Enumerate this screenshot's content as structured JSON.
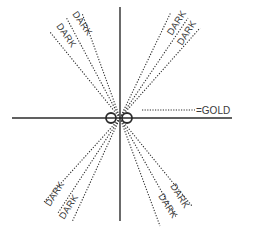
{
  "diagram": {
    "colors": {
      "ink": "#2b2b2b",
      "background": "#ffffff"
    },
    "axes": {
      "horizontal": {
        "x1": 12,
        "y1": 118,
        "x2": 232,
        "y2": 118
      },
      "vertical": {
        "x1": 120,
        "y1": 7,
        "x2": 120,
        "y2": 221
      }
    },
    "center_rings": [
      {
        "cx": 111,
        "cy": 118,
        "r": 5
      },
      {
        "cx": 127,
        "cy": 118,
        "r": 5
      }
    ],
    "legend": {
      "line": {
        "x1": 142,
        "y1": 110,
        "x2": 195,
        "y2": 110
      },
      "text": "=GOLD",
      "x": 196,
      "y": 114
    },
    "beams": [
      {
        "name": "upper-left-outer",
        "x2": 50,
        "y2": 32
      },
      {
        "name": "upper-left-mid",
        "x2": 66,
        "y2": 17
      },
      {
        "name": "upper-left-inner",
        "x2": 82,
        "y2": 13
      },
      {
        "name": "upper-right-inner",
        "x2": 171,
        "y2": 12
      },
      {
        "name": "upper-right-mid",
        "x2": 188,
        "y2": 18
      },
      {
        "name": "upper-right-outer",
        "x2": 200,
        "y2": 28
      },
      {
        "name": "lower-left-outer",
        "x2": 44,
        "y2": 202
      },
      {
        "name": "lower-left-mid",
        "x2": 58,
        "y2": 213
      },
      {
        "name": "lower-left-inner",
        "x2": 72,
        "y2": 222
      },
      {
        "name": "lower-right-inner",
        "x2": 160,
        "y2": 226
      },
      {
        "name": "lower-right-mid",
        "x2": 176,
        "y2": 217
      },
      {
        "name": "lower-right-outer",
        "x2": 192,
        "y2": 206
      }
    ],
    "labels": [
      {
        "text": "DARK",
        "x": 56,
        "y": 26,
        "rotate": 55
      },
      {
        "text": "DARK",
        "x": 72,
        "y": 14,
        "rotate": 55
      },
      {
        "text": "DARK",
        "x": 172,
        "y": 36,
        "rotate": -58
      },
      {
        "text": "DARK",
        "x": 182,
        "y": 46,
        "rotate": -58
      },
      {
        "text": "DARK",
        "x": 50,
        "y": 207,
        "rotate": -58
      },
      {
        "text": "DARK",
        "x": 64,
        "y": 220,
        "rotate": -58
      },
      {
        "text": "DARK",
        "x": 170,
        "y": 186,
        "rotate": 58
      },
      {
        "text": "DARK",
        "x": 158,
        "y": 196,
        "rotate": 58
      }
    ]
  }
}
